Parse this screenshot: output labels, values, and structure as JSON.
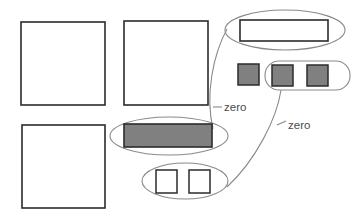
{
  "canvas": {
    "width": 360,
    "height": 220,
    "background": "#ffffff"
  },
  "palette": {
    "shape_stroke": "#2b2b2b",
    "shape_fill_empty": "#ffffff",
    "shape_fill_filled": "#808080",
    "group_stroke": "#8a8a8a",
    "connector_stroke": "#8a8a8a",
    "label_color": "#4a4a4a"
  },
  "labels": [
    {
      "id": "zero-label-1",
      "text": "zero",
      "x": 224,
      "y": 108
    },
    {
      "id": "zero-label-2",
      "text": "zero",
      "x": 288,
      "y": 126
    }
  ],
  "shapes": {
    "plain_squares": [
      {
        "id": "square-top-left",
        "x": 21,
        "y": 22,
        "w": 84,
        "h": 83,
        "fill": "#ffffff"
      },
      {
        "id": "square-top-middle",
        "x": 124,
        "y": 21,
        "w": 84,
        "h": 84,
        "fill": "#ffffff"
      },
      {
        "id": "square-bottom-left",
        "x": 22,
        "y": 125,
        "w": 83,
        "h": 83,
        "fill": "#ffffff"
      }
    ],
    "standalone_filled_square": {
      "id": "filled-square-standalone",
      "x": 238,
      "y": 64,
      "w": 21,
      "h": 21,
      "fill": "#808080"
    },
    "grouped_white_bar": {
      "id": "white-bar",
      "x": 240,
      "y": 20,
      "w": 88,
      "h": 21,
      "fill": "#ffffff"
    },
    "grouped_gray_bar": {
      "id": "gray-bar",
      "x": 124,
      "y": 124,
      "w": 88,
      "h": 23,
      "fill": "#808080"
    },
    "grouped_filled_squares": [
      {
        "id": "filled-square-pair-left",
        "x": 272,
        "y": 65,
        "w": 21,
        "h": 21,
        "fill": "#808080"
      },
      {
        "id": "filled-square-pair-right",
        "x": 307,
        "y": 65,
        "w": 21,
        "h": 21,
        "fill": "#808080"
      }
    ],
    "grouped_white_squares": [
      {
        "id": "white-square-pair-left",
        "x": 156,
        "y": 170,
        "w": 21,
        "h": 23,
        "fill": "#ffffff"
      },
      {
        "id": "white-square-pair-right",
        "x": 189,
        "y": 170,
        "w": 21,
        "h": 23,
        "fill": "#ffffff"
      }
    ]
  },
  "groupings": [
    {
      "id": "group-white-bar",
      "kind": "ellipse",
      "cx": 285,
      "cy": 30,
      "rx": 60,
      "ry": 20
    },
    {
      "id": "group-filled-square-pair",
      "kind": "rounded-rect",
      "x": 265,
      "y": 61,
      "w": 85,
      "h": 29,
      "r": 14
    },
    {
      "id": "group-gray-bar",
      "kind": "ellipse",
      "cx": 169,
      "cy": 136,
      "rx": 59,
      "ry": 19
    },
    {
      "id": "group-white-square-pair",
      "kind": "ellipse",
      "cx": 185,
      "cy": 181,
      "rx": 43,
      "ry": 18
    }
  ],
  "connectors": [
    {
      "id": "connector-zero-1",
      "from": "group-white-bar",
      "to": "group-gray-bar",
      "path": "M 227 29 C 213 55, 205 95, 213 129",
      "tick": "M 213 107 L 222 107"
    },
    {
      "id": "connector-zero-2",
      "from": "group-filled-square-pair",
      "to": "group-white-square-pair",
      "path": "M 281 90 C 277 118, 256 160, 227 187",
      "tick": "M 277 125 L 286 121"
    }
  ]
}
